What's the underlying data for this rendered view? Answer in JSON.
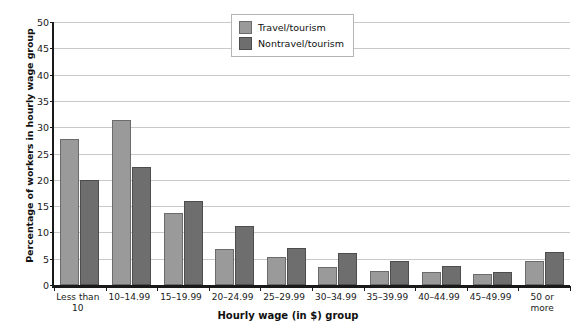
{
  "chart_data": {
    "type": "bar",
    "title": "",
    "xlabel": "Hourly wage (in $) group",
    "ylabel": "Percentage of workers in hourly wage group",
    "ylim": [
      0,
      50
    ],
    "ytick_step": 5,
    "yticks": [
      "0",
      "5",
      "10",
      "15",
      "20",
      "25",
      "30",
      "35",
      "40",
      "45",
      "50"
    ],
    "grid": true,
    "legend_position": "top-center",
    "categories": [
      "Less than 10",
      "10–14.99",
      "15–19.99",
      "20–24.99",
      "25–29.99",
      "30–34.99",
      "35–39.99",
      "40–44.99",
      "45–49.99",
      "50 or more"
    ],
    "category_lines": [
      [
        "Less than",
        "10"
      ],
      [
        "10–14.99"
      ],
      [
        "15–19.99"
      ],
      [
        "20–24.99"
      ],
      [
        "25–29.99"
      ],
      [
        "30–34.99"
      ],
      [
        "35–39.99"
      ],
      [
        "40–44.99"
      ],
      [
        "45–49.99"
      ],
      [
        "50 or",
        "more"
      ]
    ],
    "series": [
      {
        "name": "Travel/tourism",
        "color": "#9a9a9a",
        "values": [
          27.7,
          31.3,
          13.7,
          6.8,
          5.3,
          3.4,
          2.7,
          2.4,
          2.0,
          4.5
        ]
      },
      {
        "name": "Nontravel/tourism",
        "color": "#6e6e6e",
        "values": [
          20.0,
          22.4,
          15.9,
          11.2,
          7.0,
          6.0,
          4.6,
          3.6,
          2.4,
          6.2
        ]
      }
    ]
  },
  "legend": {
    "items": [
      {
        "label": "Travel/tourism"
      },
      {
        "label": "Nontravel/tourism"
      }
    ]
  }
}
